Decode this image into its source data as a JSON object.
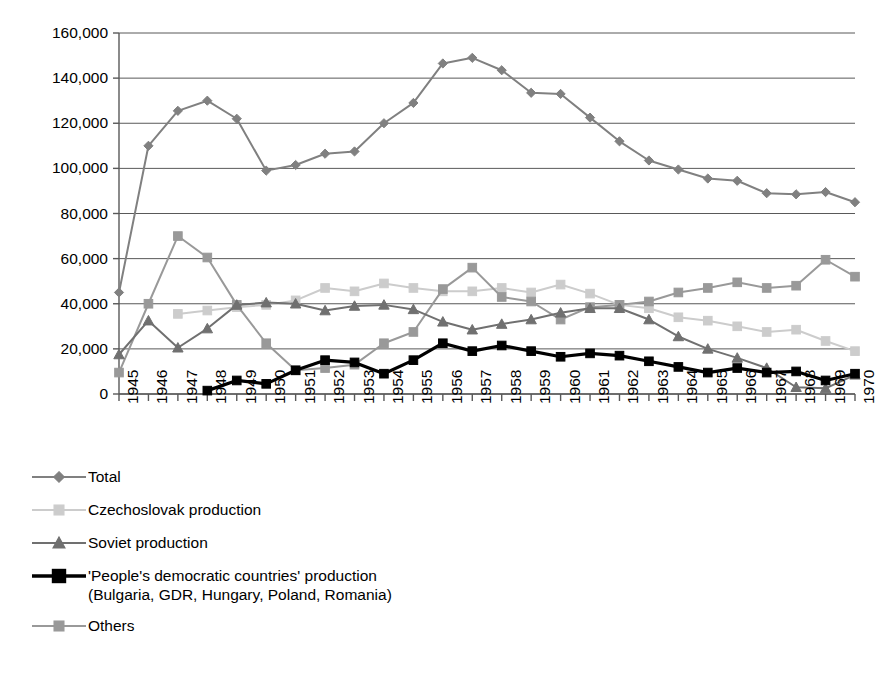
{
  "chart_data": {
    "type": "line",
    "title": "",
    "xlabel": "",
    "ylabel": "",
    "grid": true,
    "legend_position": "bottom-left",
    "ylim": [
      0,
      160000
    ],
    "ytick_step": 20000,
    "ytick_labels": [
      "160,000",
      "140,000",
      "120,000",
      "100,000",
      "80,000",
      "60,000",
      "40,000",
      "20,000",
      "0"
    ],
    "ytick_values": [
      160000,
      140000,
      120000,
      100000,
      80000,
      60000,
      40000,
      20000,
      0
    ],
    "categories": [
      "1945",
      "1946",
      "1947",
      "1948",
      "1949",
      "1950",
      "1951",
      "1952",
      "1953",
      "1954",
      "1955",
      "1956",
      "1957",
      "1958",
      "1959",
      "1960",
      "1961",
      "1962",
      "1963",
      "1964",
      "1965",
      "1966",
      "1967",
      "1968",
      "1969",
      "1970"
    ],
    "series": [
      {
        "name": "Total",
        "marker": "diamond",
        "color": "#808080",
        "values": [
          45000,
          110000,
          125500,
          130000,
          122000,
          99000,
          101500,
          106500,
          107500,
          120000,
          129000,
          146500,
          149000,
          143500,
          133500,
          133000,
          122500,
          112000,
          103500,
          99500,
          95500,
          94500,
          89000,
          88500,
          89500,
          85000
        ]
      },
      {
        "name": "Czechoslovak production",
        "marker": "square",
        "color": "#cccccc",
        "values": [
          null,
          null,
          35500,
          37000,
          38500,
          39500,
          41500,
          47000,
          45500,
          49000,
          47000,
          45500,
          45500,
          47000,
          45000,
          48500,
          44500,
          39500,
          38000,
          34000,
          32500,
          30000,
          27500,
          28500,
          23500,
          19000
        ]
      },
      {
        "name": "Soviet production",
        "marker": "triangle",
        "color": "#707070",
        "values": [
          17500,
          32500,
          20500,
          29000,
          39500,
          40500,
          40000,
          37000,
          39000,
          39500,
          37500,
          32000,
          28500,
          31000,
          33000,
          36000,
          38000,
          38000,
          33000,
          25500,
          20000,
          16000,
          11500,
          3000,
          2500,
          8500
        ]
      },
      {
        "name": "'People's democratic countries' production\n(Bulgaria, GDR, Hungary, Poland, Romania)",
        "marker": "square",
        "color": "#000000",
        "values": [
          null,
          null,
          null,
          1500,
          6000,
          4500,
          10500,
          15000,
          14000,
          9000,
          15000,
          22500,
          19000,
          21500,
          19000,
          16500,
          18000,
          17000,
          14500,
          12000,
          9500,
          11500,
          9500,
          10000,
          6000,
          9000
        ]
      },
      {
        "name": "Others",
        "marker": "square",
        "color": "#999999",
        "values": [
          9500,
          40000,
          70000,
          60500,
          39500,
          22500,
          10500,
          11500,
          13000,
          22500,
          27500,
          46500,
          56000,
          43000,
          41000,
          33000,
          38500,
          39500,
          41000,
          45000,
          47000,
          49500,
          47000,
          48000,
          59500,
          52000
        ]
      }
    ]
  },
  "legend": {
    "entries": [
      {
        "label": "Total",
        "marker": "diamond-icon",
        "color": "#808080"
      },
      {
        "label": "Czechoslovak production",
        "marker": "square-icon",
        "color": "#cccccc"
      },
      {
        "label": "Soviet production",
        "marker": "triangle-icon",
        "color": "#707070"
      },
      {
        "label": "'People's democratic countries' production\n(Bulgaria, GDR, Hungary, Poland, Romania)",
        "marker": "square-icon",
        "color": "#000000"
      },
      {
        "label": "Others",
        "marker": "square-icon",
        "color": "#999999"
      }
    ]
  }
}
